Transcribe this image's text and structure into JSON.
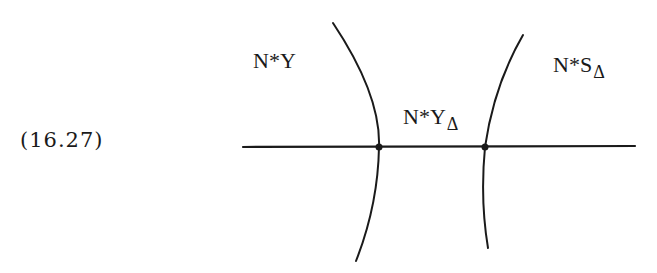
{
  "equation_number": "(16.27)",
  "labels": {
    "left_region": {
      "main": "N*Y",
      "sub": ""
    },
    "middle_region": {
      "main": "N*Y",
      "sub": "Δ"
    },
    "right_region": {
      "main": "N*S",
      "sub": "Δ"
    }
  },
  "geometry": {
    "horizontal_line": {
      "x1": 243,
      "y1": 147,
      "x2": 635,
      "y2": 146
    },
    "left_curve": {
      "top": [
        333,
        23
      ],
      "intersection": [
        379,
        147
      ],
      "bottom": [
        356,
        261
      ]
    },
    "right_curve": {
      "top": [
        523,
        35
      ],
      "intersection": [
        485,
        147
      ],
      "bottom": [
        488,
        248
      ]
    },
    "intersection_points": [
      [
        379,
        147
      ],
      [
        485,
        147
      ]
    ]
  },
  "colors": {
    "stroke": "#1a1a1a",
    "background": "#ffffff"
  }
}
